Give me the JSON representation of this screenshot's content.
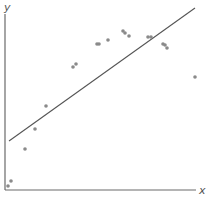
{
  "chart_data": {
    "type": "scatter",
    "title": "",
    "xlabel": "x",
    "ylabel": "y",
    "grid": false,
    "legend": null,
    "ticks": {
      "x": [],
      "y": []
    },
    "axis_pixel_frame": {
      "origin": [
        5,
        190
      ],
      "x_end": 196,
      "y_top": 14
    },
    "points_pixel": [
      [
        8,
        186
      ],
      [
        11,
        181
      ],
      [
        25,
        149
      ],
      [
        35,
        129
      ],
      [
        46,
        106
      ],
      [
        73,
        67
      ],
      [
        76,
        64
      ],
      [
        97,
        44
      ],
      [
        99,
        44
      ],
      [
        108,
        40
      ],
      [
        123,
        31
      ],
      [
        125,
        33
      ],
      [
        129,
        36
      ],
      [
        148,
        37
      ],
      [
        151,
        37
      ],
      [
        163,
        44
      ],
      [
        165,
        45
      ],
      [
        167,
        48
      ],
      [
        195,
        77
      ]
    ],
    "points_normalized": [
      {
        "x": 0.02,
        "y": 0.02
      },
      {
        "x": 0.03,
        "y": 0.05
      },
      {
        "x": 0.1,
        "y": 0.24
      },
      {
        "x": 0.16,
        "y": 0.35
      },
      {
        "x": 0.22,
        "y": 0.48
      },
      {
        "x": 0.36,
        "y": 0.7
      },
      {
        "x": 0.37,
        "y": 0.72
      },
      {
        "x": 0.48,
        "y": 0.83
      },
      {
        "x": 0.49,
        "y": 0.83
      },
      {
        "x": 0.54,
        "y": 0.85
      },
      {
        "x": 0.62,
        "y": 0.9
      },
      {
        "x": 0.63,
        "y": 0.89
      },
      {
        "x": 0.65,
        "y": 0.88
      },
      {
        "x": 0.75,
        "y": 0.87
      },
      {
        "x": 0.77,
        "y": 0.87
      },
      {
        "x": 0.83,
        "y": 0.83
      },
      {
        "x": 0.84,
        "y": 0.82
      },
      {
        "x": 0.85,
        "y": 0.81
      },
      {
        "x": 1.0,
        "y": 0.64
      }
    ],
    "regression_line_pixel": {
      "x1": 9,
      "y1": 141,
      "x2": 195,
      "y2": 8
    },
    "regression_line_normalized": {
      "x1": 0.02,
      "y1": 0.28,
      "x2": 1.0,
      "y2": 1.03
    },
    "annotation": "Linear fit line over nonlinear (concave) data"
  },
  "colors": {
    "axis": "#6a6a6a",
    "line": "#555555",
    "point": "#8a8a8a",
    "label": "#555555"
  }
}
